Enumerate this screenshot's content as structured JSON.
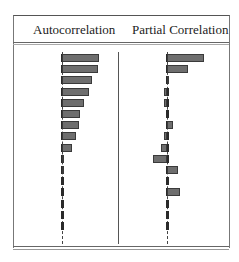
{
  "chart_data": {
    "type": "bar",
    "orientation": "horizontal",
    "title": "",
    "panels": [
      {
        "name": "Autocorrelation",
        "header": "Autocorrelation",
        "lags": [
          1,
          2,
          3,
          4,
          5,
          6,
          7,
          8,
          9,
          10,
          11,
          12,
          13,
          14,
          15,
          16
        ],
        "values": [
          0.92,
          0.9,
          0.76,
          0.68,
          0.55,
          0.46,
          0.43,
          0.34,
          0.26,
          0.04,
          0.05,
          0.0,
          -0.03,
          0.02,
          0.03,
          0.01
        ],
        "xlim": [
          -1,
          1
        ]
      },
      {
        "name": "Partial Correlation",
        "header": "Partial Correlation",
        "lags": [
          1,
          2,
          3,
          4,
          5,
          6,
          7,
          8,
          9,
          10,
          11,
          12,
          13,
          14,
          15,
          16
        ],
        "values": [
          0.92,
          0.52,
          0.04,
          -0.08,
          -0.08,
          0.02,
          0.16,
          -0.08,
          -0.14,
          -0.36,
          0.27,
          0.03,
          0.32,
          0.02,
          0.0,
          0.0
        ],
        "xlim": [
          -1,
          1
        ]
      }
    ],
    "grid": false,
    "legend": null
  },
  "headers": {
    "left": "Autocorrelation",
    "right": "Partial Correlation"
  }
}
